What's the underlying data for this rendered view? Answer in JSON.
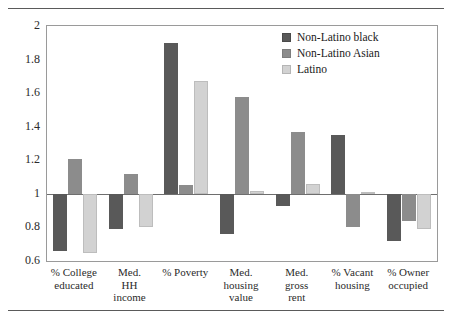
{
  "chart_data": {
    "type": "bar",
    "title": "",
    "subtitle": "",
    "xlabel": "",
    "ylabel": "",
    "ylim": [
      0.6,
      2
    ],
    "ytick_labels": [
      "2",
      "1.8",
      "1.6",
      "1.4",
      "1.2",
      "1",
      "0.8",
      "0.6"
    ],
    "ytick_values": [
      2,
      1.8,
      1.6,
      1.4,
      1.2,
      1,
      0.8,
      0.6
    ],
    "baseline": 1,
    "grid": false,
    "legend_position": "top-right",
    "categories": [
      "% College educated",
      "Med. HH income",
      "% Poverty",
      "Med. housing value",
      "Med. gross rent",
      "% Vacant housing",
      "% Owner occupied"
    ],
    "category_lines": [
      [
        "% College",
        "educated"
      ],
      [
        "Med.",
        "HH",
        "income"
      ],
      [
        "% Poverty"
      ],
      [
        "Med.",
        "housing",
        "value"
      ],
      [
        "Med.",
        "gross",
        "rent"
      ],
      [
        "% Vacant",
        "housing"
      ],
      [
        "% Owner",
        "occupied"
      ]
    ],
    "series": [
      {
        "name": "Non-Latino black",
        "color": "#595959",
        "values": [
          0.66,
          0.79,
          1.9,
          0.76,
          0.93,
          1.35,
          0.72
        ]
      },
      {
        "name": "Non-Latino Asian",
        "color": "#8c8c8c",
        "values": [
          1.21,
          1.12,
          1.05,
          1.58,
          1.37,
          0.8,
          0.84
        ]
      },
      {
        "name": "Latino",
        "color": "#d2d2d2",
        "values": [
          0.65,
          0.8,
          1.67,
          1.02,
          1.06,
          1.01,
          0.79
        ]
      }
    ]
  },
  "legend": {
    "items": [
      {
        "label": "Non-Latino black",
        "color": "#595959"
      },
      {
        "label": "Non-Latino Asian",
        "color": "#8c8c8c"
      },
      {
        "label": "Latino",
        "color": "#d2d2d2"
      }
    ]
  }
}
